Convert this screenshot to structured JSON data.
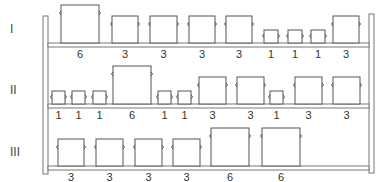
{
  "shelves": [
    {
      "label": "I",
      "label_y": 43,
      "shelf_y": 43,
      "items": [
        {
          "value": "6",
          "x": 61,
          "w": 38
        },
        {
          "value": "3",
          "x": 112,
          "w": 26
        },
        {
          "value": "3",
          "x": 150,
          "w": 27
        },
        {
          "value": "3",
          "x": 189,
          "w": 26
        },
        {
          "value": "3",
          "x": 226,
          "w": 26
        },
        {
          "value": "1",
          "x": 264,
          "w": 14
        },
        {
          "value": "1",
          "x": 288,
          "w": 14
        },
        {
          "value": "1",
          "x": 311,
          "w": 14
        },
        {
          "value": "3",
          "x": 333,
          "w": 26
        }
      ]
    },
    {
      "label": "II",
      "label_y": 104,
      "shelf_y": 104,
      "items": [
        {
          "value": "1",
          "x": 52,
          "w": 13
        },
        {
          "value": "1",
          "x": 72,
          "w": 13
        },
        {
          "value": "1",
          "x": 93,
          "w": 13
        },
        {
          "value": "6",
          "x": 113,
          "w": 38
        },
        {
          "value": "1",
          "x": 158,
          "w": 13
        },
        {
          "value": "1",
          "x": 178,
          "w": 13
        },
        {
          "value": "3",
          "x": 199,
          "w": 27
        },
        {
          "value": "3",
          "x": 237,
          "w": 27
        },
        {
          "value": "1",
          "x": 270,
          "w": 13
        },
        {
          "value": "3",
          "x": 295,
          "w": 27
        },
        {
          "value": "3",
          "x": 333,
          "w": 27
        }
      ]
    },
    {
      "label": "III",
      "label_y": 166,
      "shelf_y": 166,
      "items": [
        {
          "value": "3",
          "x": 58,
          "w": 26
        },
        {
          "value": "3",
          "x": 96,
          "w": 27
        },
        {
          "value": "3",
          "x": 135,
          "w": 27
        },
        {
          "value": "3",
          "x": 173,
          "w": 27
        },
        {
          "value": "6",
          "x": 211,
          "w": 38
        },
        {
          "value": "6",
          "x": 262,
          "w": 38
        }
      ]
    }
  ]
}
